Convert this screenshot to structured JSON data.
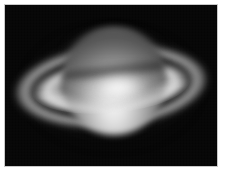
{
  "page": {
    "background_color": "#ffffff"
  },
  "photo": {
    "subject": "Saturn",
    "capture_type": "telescope astrophotograph",
    "color_mode": "grayscale",
    "alt_text": "Grayscale telescope photograph of the planet Saturn showing its bright disk and open ring system with a dark ring division",
    "frame": {
      "border_color": "#c8c8c8",
      "border_width_px": 1,
      "left_px": 4,
      "top_px": 4,
      "width_px": 214,
      "height_px": 163
    },
    "sky": {
      "label": "night sky background",
      "color": "#050505"
    },
    "features": [
      {
        "name": "planet-globe",
        "label": "Saturn globe",
        "center_x_px": 109,
        "center_y_px": 76,
        "width_px": 104,
        "height_px": 108,
        "bright_color": "#f4f4f4",
        "limb_color": "#242424"
      },
      {
        "name": "planet-north",
        "label": "northern hemisphere (dimmer)",
        "color": "#3c3c3c"
      },
      {
        "name": "planet-core",
        "label": "bright equatorial band",
        "color": "#fcfcfc"
      },
      {
        "name": "ring-shadow",
        "label": "ring shadow on globe",
        "color": "#121212"
      },
      {
        "name": "ring-outer",
        "label": "outer ring (A ring)",
        "span_x_px": [
          8,
          204
        ],
        "color": "#c4c4c4"
      },
      {
        "name": "ring-division",
        "label": "ring division gap",
        "color": "#0a0a0a"
      },
      {
        "name": "ring-inner",
        "label": "inner bright ring (B ring)",
        "span_x_px": [
          27,
          185
        ],
        "color": "#dedede"
      },
      {
        "name": "ring-front",
        "label": "near-side ring arc crossing the globe",
        "color": "#e4e4e4"
      },
      {
        "name": "halo",
        "label": "diffuse glow halo",
        "color": "#787878"
      }
    ],
    "ring_tilt_degrees": -5
  }
}
